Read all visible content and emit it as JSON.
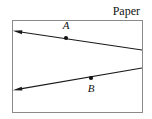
{
  "figure": {
    "width": 152,
    "height": 119,
    "background_color": "#ffffff",
    "region_label": "Paper"
  },
  "paper_boundary": {
    "name": "paper-rectangle",
    "x": 12,
    "y": 20,
    "width": 130,
    "height": 92,
    "stroke_color": "#8a8a8a",
    "fill_color": "#ffffff"
  },
  "region_label": {
    "text": "Paper",
    "x": 140,
    "y": 15,
    "color": "#111111"
  },
  "lines": [
    {
      "name": "upper-ray",
      "from_x": 14,
      "from_y": 31,
      "to_x": 142,
      "to_y": 50,
      "arrow_at": "start",
      "color": "#1a1a1a"
    },
    {
      "name": "lower-ray",
      "from_x": 14,
      "from_y": 90,
      "to_x": 142,
      "to_y": 68,
      "arrow_at": "start",
      "color": "#1a1a1a"
    }
  ],
  "points": [
    {
      "name": "point-a",
      "label": "A",
      "x": 66,
      "y": 38,
      "label_x": 66,
      "label_y": 29,
      "label_position": "above",
      "radius": 2.1,
      "color": "#111111"
    },
    {
      "name": "point-b",
      "label": "B",
      "x": 91,
      "y": 78,
      "label_x": 91,
      "label_y": 92,
      "label_position": "below",
      "radius": 2.1,
      "color": "#111111"
    }
  ]
}
